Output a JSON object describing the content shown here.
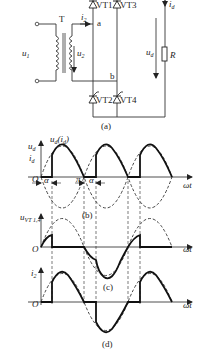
{
  "figure": {
    "circuit": {
      "caption": "(a)",
      "transformer_label": "T",
      "input_voltage": "u",
      "input_voltage_sub": "1",
      "secondary_voltage": "u",
      "secondary_voltage_sub": "2",
      "secondary_current": "i",
      "secondary_current_sub": "2",
      "node_a": "a",
      "node_b": "b",
      "thyristors": [
        {
          "label": "VT1"
        },
        {
          "label": "VT3"
        },
        {
          "label": "VT2"
        },
        {
          "label": "VT4"
        }
      ],
      "load_voltage": "u",
      "load_voltage_sub": "d",
      "load_current": "i",
      "load_current_sub": "d",
      "resistor": "R"
    },
    "waveform_b": {
      "caption": "(b)",
      "title": "u",
      "title_sub": "d",
      "title_paren": "(i",
      "title_paren_sub": "d",
      "title_close": ")",
      "y_label_1": "u",
      "y_label_1_sub": "d",
      "y_label_2": "i",
      "y_label_2_sub": "d",
      "origin": "O",
      "alpha_1": "α",
      "pi_label": "π",
      "alpha_2": "α",
      "x_label": "ωt"
    },
    "waveform_c": {
      "caption": "(c)",
      "y_label": "u",
      "y_label_sub": "VT 1,4",
      "origin": "O",
      "x_label": "ωt"
    },
    "waveform_d": {
      "caption": "(d)",
      "y_label": "i",
      "y_label_sub": "2",
      "origin": "O",
      "x_label": "ωt"
    }
  }
}
